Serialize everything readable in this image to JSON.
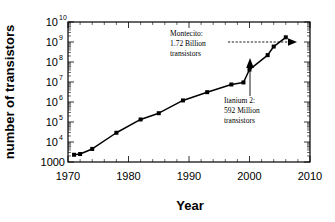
{
  "chart_data": {
    "type": "line",
    "title": "",
    "subtitle": "",
    "xlabel": "Year",
    "ylabel": "number of transistors",
    "xlim": [
      1970,
      2010
    ],
    "ylim": [
      1000,
      10000000000
    ],
    "yscale": "log",
    "grid": false,
    "legend": "none",
    "x_ticks": [
      "1970",
      "1980",
      "1990",
      "2000",
      "2010"
    ],
    "x_tick_values": [
      1970,
      1980,
      1990,
      2000,
      2010
    ],
    "y_ticks": [
      "1000",
      "10^4",
      "10^5",
      "10^6",
      "10^7",
      "10^8",
      "10^9",
      "10^10"
    ],
    "y_tick_values": [
      1000,
      10000,
      100000,
      1000000,
      10000000,
      100000000,
      1000000000,
      10000000000
    ],
    "y_tick_display": [
      {
        "mantissa": "1000",
        "exponent": ""
      },
      {
        "mantissa": "10",
        "exponent": "4"
      },
      {
        "mantissa": "10",
        "exponent": "5"
      },
      {
        "mantissa": "10",
        "exponent": "6"
      },
      {
        "mantissa": "10",
        "exponent": "7"
      },
      {
        "mantissa": "10",
        "exponent": "8"
      },
      {
        "mantissa": "10",
        "exponent": "9"
      },
      {
        "mantissa": "10",
        "exponent": "10"
      }
    ],
    "series": [
      {
        "name": "transistor count",
        "marker": "filled-square",
        "color": "#000000",
        "x": [
          1971,
          1972,
          1974,
          1978,
          1982,
          1985,
          1989,
          1993,
          1997,
          1999,
          2000,
          2003,
          2004,
          2006
        ],
        "y": [
          2300,
          2500,
          4500,
          29000,
          134000,
          275000,
          1200000,
          3100000,
          7500000,
          9500000,
          42000000,
          220000000,
          592000000,
          1720000000
        ]
      }
    ],
    "annotations": [
      {
        "id": "montecito",
        "lines": [
          "Montecito:",
          "1.72 Billion",
          "transistors"
        ],
        "point_x": 2006,
        "point_y": 1720000000,
        "arrow": "dashed-horizontal"
      },
      {
        "id": "itanium2",
        "lines": [
          "Itanium 2:",
          "592 Million",
          "transistors"
        ],
        "point_x": 2004,
        "point_y": 592000000,
        "arrow": "solid-vertical"
      }
    ],
    "colors": {
      "line": "#000000",
      "marker": "#000000",
      "axis": "#000000",
      "background": "#ffffff"
    }
  }
}
